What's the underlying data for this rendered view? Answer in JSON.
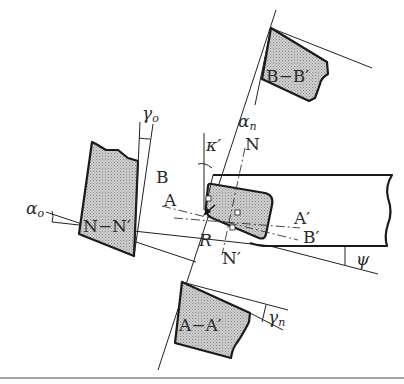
{
  "figure": {
    "labels": {
      "section_nn": "N−N′",
      "section_aa": "A−A′",
      "section_bb": "B−B′",
      "point_a": "A",
      "point_a_prime": "A′",
      "point_b": "B",
      "point_b_prime": "B′",
      "point_n": "N",
      "point_n_prime": "N′",
      "point_r": "R",
      "angle_alpha_o_base": "α",
      "angle_alpha_o_sub": "o",
      "angle_gamma_o_base": "γ",
      "angle_gamma_o_sub": "o",
      "angle_alpha_n_base": "α",
      "angle_alpha_n_sub": "n",
      "angle_gamma_n_base": "γ",
      "angle_gamma_n_sub": "n",
      "angle_kappa_prime": "κ′",
      "angle_psi": "ψ"
    },
    "colors": {
      "line": "#1a1a1a",
      "fill_shade": "#c8c8c8",
      "background": "#ffffff",
      "bottom_rule": "#888888"
    }
  }
}
